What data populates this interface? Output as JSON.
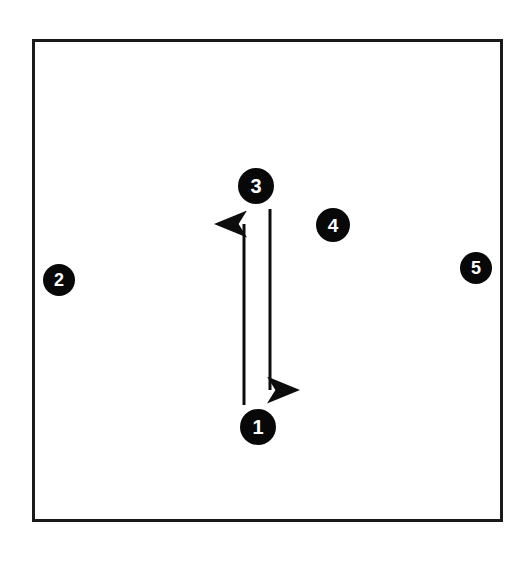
{
  "figure": {
    "type": "node-link-diagram",
    "background_color": "#ffffff",
    "frame": {
      "name": "boundary-rectangle",
      "stroke_color": "#1a1a1a",
      "stroke_width": 3,
      "x": 32,
      "y": 39,
      "width": 471,
      "height": 483
    },
    "node_style": {
      "fill_color": "#080808",
      "label_color": "#ffffff"
    },
    "nodes": [
      {
        "id": "node-1",
        "label": "1",
        "cx": 258,
        "cy": 427,
        "r": 18,
        "font_size": 20
      },
      {
        "id": "node-2",
        "label": "2",
        "cx": 59,
        "cy": 280,
        "r": 16,
        "font_size": 18
      },
      {
        "id": "node-3",
        "label": "3",
        "cx": 256,
        "cy": 186,
        "r": 18,
        "font_size": 20
      },
      {
        "id": "node-4",
        "label": "4",
        "cx": 333,
        "cy": 225,
        "r": 17,
        "font_size": 19
      },
      {
        "id": "node-5",
        "label": "5",
        "cx": 476,
        "cy": 268,
        "r": 16,
        "font_size": 18
      }
    ],
    "edges": [
      {
        "id": "edge-1-to-3",
        "name": "arrow-up-node1-to-node3",
        "from": "1",
        "to": "3",
        "direction": "up",
        "x": 244,
        "y_start": 405,
        "y_end": 212,
        "stroke_color": "#0d0d0d",
        "stroke_width": 3
      },
      {
        "id": "edge-3-to-1",
        "name": "arrow-down-node3-to-node1",
        "from": "3",
        "to": "1",
        "direction": "down",
        "x": 270,
        "y_start": 209,
        "y_end": 402,
        "stroke_color": "#0d0d0d",
        "stroke_width": 3
      }
    ]
  }
}
